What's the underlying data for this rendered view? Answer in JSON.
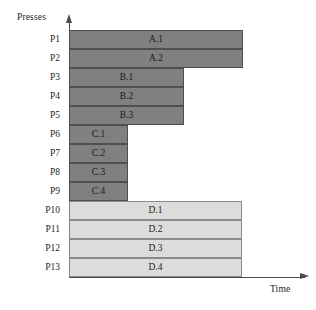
{
  "axes": {
    "y_title": "Presses",
    "x_title": "Time",
    "y_arrow_icon": "arrow-up-icon",
    "x_arrow_icon": "arrow-right-icon"
  },
  "colors": {
    "dark_bar_fill": "#808080",
    "dark_bar_stroke": "#4f4f4f",
    "light_bar_fill": "#dcdcdc",
    "light_bar_stroke": "#8a8a8a",
    "axis": "#4a4a4a",
    "text": "#231f20",
    "background": "#ffffff"
  },
  "chart_data": {
    "type": "bar",
    "title": "",
    "xlabel": "Time",
    "ylabel": "Presses",
    "orientation": "horizontal",
    "grid": false,
    "legend": "none",
    "categories": [
      "P1",
      "P2",
      "P3",
      "P4",
      "P5",
      "P6",
      "P7",
      "P8",
      "P9",
      "P10",
      "P11",
      "P12",
      "P13"
    ],
    "values": [
      87,
      87,
      66,
      66,
      66,
      25,
      25,
      25,
      25,
      86,
      86,
      86,
      86
    ],
    "xlim": [
      0,
      100
    ],
    "series": [
      {
        "name": "A",
        "shade": "dark",
        "bars": [
          {
            "row": "P1",
            "label": "A.1",
            "start": 0,
            "end": 87
          },
          {
            "row": "P2",
            "label": "A.2",
            "start": 0,
            "end": 87
          }
        ]
      },
      {
        "name": "B",
        "shade": "dark",
        "bars": [
          {
            "row": "P3",
            "label": "B.1",
            "start": 0,
            "end": 66
          },
          {
            "row": "P4",
            "label": "B.2",
            "start": 0,
            "end": 66
          },
          {
            "row": "P5",
            "label": "B.3",
            "start": 0,
            "end": 66
          }
        ]
      },
      {
        "name": "C",
        "shade": "dark",
        "bars": [
          {
            "row": "P6",
            "label": "C.1",
            "start": 0,
            "end": 25
          },
          {
            "row": "P7",
            "label": "C.2",
            "start": 0,
            "end": 25
          },
          {
            "row": "P8",
            "label": "C.3",
            "start": 0,
            "end": 25
          },
          {
            "row": "P9",
            "label": "C.4",
            "start": 0,
            "end": 25
          }
        ]
      },
      {
        "name": "D",
        "shade": "light",
        "bars": [
          {
            "row": "P10",
            "label": "D.1",
            "start": 0,
            "end": 86
          },
          {
            "row": "P11",
            "label": "D.2",
            "start": 0,
            "end": 86
          },
          {
            "row": "P12",
            "label": "D.3",
            "start": 0,
            "end": 86
          },
          {
            "row": "P13",
            "label": "D.4",
            "start": 0,
            "end": 86
          }
        ]
      }
    ]
  },
  "rows": [
    {
      "label": "P1",
      "bar_label": "A.1",
      "shade": "dark",
      "top": 30,
      "width": 174
    },
    {
      "label": "P2",
      "bar_label": "A.2",
      "shade": "dark",
      "top": 49,
      "width": 174
    },
    {
      "label": "P3",
      "bar_label": "B.1",
      "shade": "dark",
      "top": 68,
      "width": 115
    },
    {
      "label": "P4",
      "bar_label": "B.2",
      "shade": "dark",
      "top": 87,
      "width": 115
    },
    {
      "label": "P5",
      "bar_label": "B.3",
      "shade": "dark",
      "top": 106,
      "width": 115
    },
    {
      "label": "P6",
      "bar_label": "C.1",
      "shade": "dark",
      "top": 125,
      "width": 59
    },
    {
      "label": "P7",
      "bar_label": "C.2",
      "shade": "dark",
      "top": 144,
      "width": 59
    },
    {
      "label": "P8",
      "bar_label": "C.3",
      "shade": "dark",
      "top": 163,
      "width": 59
    },
    {
      "label": "P9",
      "bar_label": "C.4",
      "shade": "dark",
      "top": 182,
      "width": 59
    },
    {
      "label": "P10",
      "bar_label": "D.1",
      "shade": "light",
      "top": 201,
      "width": 173
    },
    {
      "label": "P11",
      "bar_label": "D.2",
      "shade": "light",
      "top": 220,
      "width": 173
    },
    {
      "label": "P12",
      "bar_label": "D.3",
      "shade": "light",
      "top": 239,
      "width": 173
    },
    {
      "label": "P13",
      "bar_label": "D.4",
      "shade": "light",
      "top": 258,
      "width": 173
    }
  ]
}
